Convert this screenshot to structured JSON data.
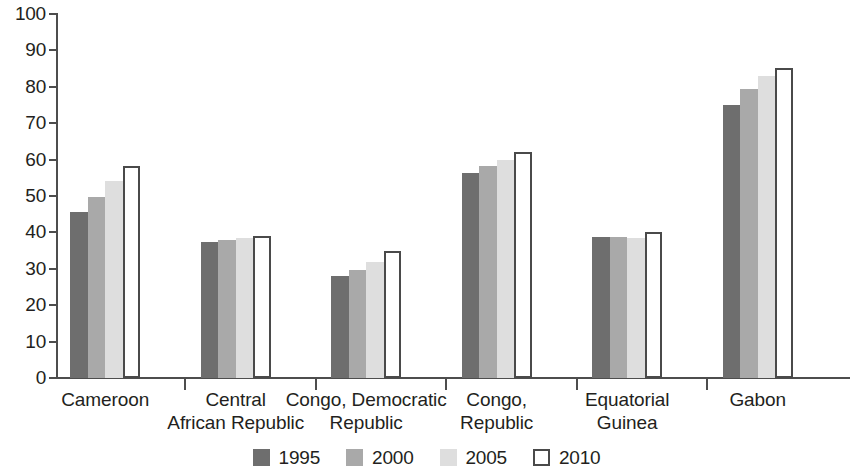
{
  "chart_data": {
    "type": "bar",
    "title": "",
    "subtitle": "",
    "xlabel": "",
    "ylabel": "",
    "ylim": [
      0,
      100
    ],
    "ytick_step": 10,
    "yticks": [
      100,
      90,
      80,
      70,
      60,
      50,
      40,
      30,
      20,
      10,
      0
    ],
    "grid": false,
    "legend_position": "bottom-center",
    "categories": [
      "Cameroon",
      "Central African Republic",
      "Congo, Democratic Republic",
      "Congo, Republic",
      "Equatorial Guinea",
      "Gabon"
    ],
    "category_lines": [
      [
        "Cameroon"
      ],
      [
        "Central",
        "African Republic"
      ],
      [
        "Congo, Democratic",
        "Republic"
      ],
      [
        "Congo,",
        "Republic"
      ],
      [
        "Equatorial",
        "Guinea"
      ],
      [
        "Gabon"
      ]
    ],
    "series": [
      {
        "name": "1995",
        "color": "#6e6e6e",
        "values": [
          45.5,
          37.3,
          28.0,
          56.2,
          38.8,
          75.0
        ]
      },
      {
        "name": "2000",
        "color": "#a9a9a9",
        "values": [
          49.8,
          38.0,
          29.7,
          58.3,
          38.7,
          79.5
        ]
      },
      {
        "name": "2005",
        "color": "#dedede",
        "values": [
          54.0,
          38.4,
          31.9,
          60.0,
          38.6,
          83.0
        ]
      },
      {
        "name": "2010",
        "color": "#ffffff",
        "values": [
          58.2,
          39.0,
          35.0,
          62.0,
          40.0,
          85.2
        ]
      }
    ]
  },
  "axis": {
    "y_labels": [
      "100",
      "90",
      "80",
      "70",
      "60",
      "50",
      "40",
      "30",
      "20",
      "10",
      "0"
    ]
  },
  "legend": {
    "items": [
      {
        "label": "1995",
        "swatch": "dark-gray-swatch"
      },
      {
        "label": "2000",
        "swatch": "medium-gray-swatch"
      },
      {
        "label": "2005",
        "swatch": "light-gray-swatch"
      },
      {
        "label": "2010",
        "swatch": "white-outline-swatch"
      }
    ]
  }
}
